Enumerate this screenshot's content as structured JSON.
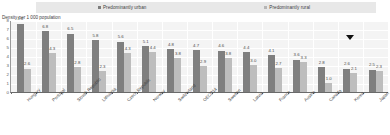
{
  "legend": {
    "urban_label": "Predominantly urban",
    "rural_label": "Predominantly rural",
    "urban_color": "#7f7f7f",
    "rural_color": "#bdbdbd"
  },
  "axis_title": "Density per 1 000 population",
  "marker": {
    "name": "triangle-marker",
    "category": "Korea",
    "glyph": "▼"
  },
  "chart_data": {
    "type": "bar",
    "title": "",
    "subtitle": "",
    "xlabel": "",
    "ylabel": "Density per 1 000 population",
    "ylim": [
      0,
      8
    ],
    "yticks": [
      0,
      1,
      2,
      3,
      4,
      5,
      6,
      7,
      8
    ],
    "ytick_labels": [
      "0",
      "1",
      "2",
      "3",
      "4",
      "5",
      "6",
      "7",
      "8"
    ],
    "grid": true,
    "legend_position": "top",
    "categories": [
      "Hungary",
      "Portugal",
      "Slovak Republic",
      "Lithuania",
      "Czech Republic",
      "Norway",
      "Switzerland",
      "OECD14",
      "Sweden",
      "Latvia",
      "France",
      "Austria",
      "Canada",
      "Korea",
      "Japan"
    ],
    "series": [
      {
        "name": "Predominantly urban",
        "color": "#7f7f7f",
        "values": [
          7.6,
          6.8,
          6.5,
          5.8,
          5.6,
          5.1,
          4.8,
          4.7,
          4.6,
          4.4,
          4.1,
          3.6,
          2.8,
          2.6,
          2.5
        ]
      },
      {
        "name": "Predominantly rural",
        "color": "#bdbdbd",
        "values": [
          2.6,
          4.3,
          2.8,
          2.3,
          4.3,
          4.4,
          3.8,
          2.9,
          3.8,
          3.0,
          2.7,
          3.3,
          1.0,
          2.1,
          2.3
        ]
      }
    ]
  }
}
